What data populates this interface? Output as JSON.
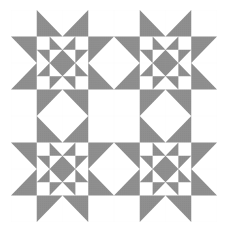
{
  "quilt": {
    "title": "",
    "grid": {
      "columns": 8,
      "rows": 8
    },
    "block_layout": {
      "columns": 2,
      "rows": 2
    },
    "block_name": "star-within-star",
    "colors": {
      "background": "#ffffff",
      "fill": "#8f8f8f",
      "grid_line": "#c6c6c6"
    },
    "blocks": [
      {
        "name": "star-block-top-left",
        "col": 0,
        "row": 0
      },
      {
        "name": "star-block-top-right",
        "col": 1,
        "row": 0
      },
      {
        "name": "star-block-bottom-left",
        "col": 0,
        "row": 1
      },
      {
        "name": "star-block-bottom-right",
        "col": 1,
        "row": 1
      }
    ]
  }
}
